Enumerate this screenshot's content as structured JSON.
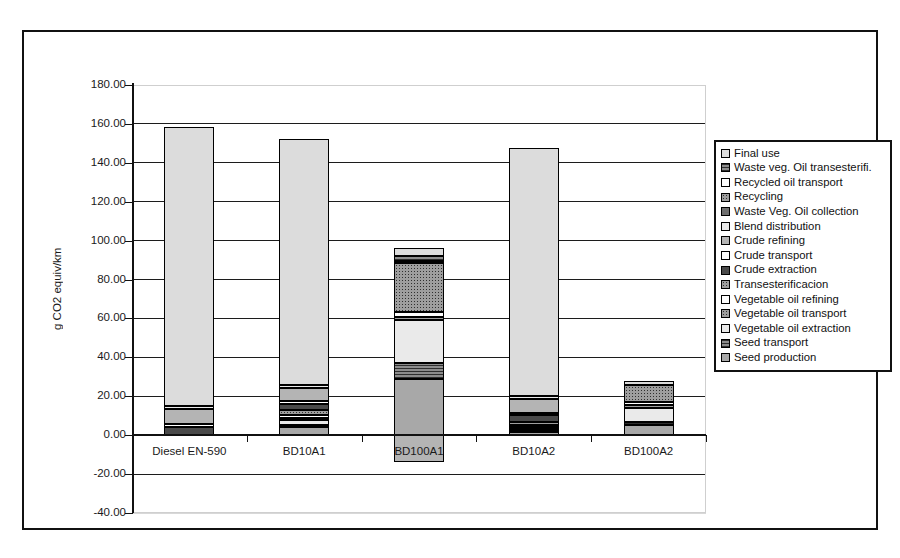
{
  "chart_data": {
    "type": "bar",
    "subtype": "stacked-bar",
    "title": "",
    "xlabel": "",
    "ylabel": "g CO2 equiv/km",
    "ylim": [
      -40,
      180
    ],
    "ytick_step": 20,
    "ytick_labels": [
      "180.00",
      "160.00",
      "140.00",
      "120.00",
      "100.00",
      "80.00",
      "60.00",
      "40.00",
      "20.00",
      "0.00",
      "-20.00",
      "-40.00"
    ],
    "ytick_values": [
      180,
      160,
      140,
      120,
      100,
      80,
      60,
      40,
      20,
      0,
      -20,
      -40
    ],
    "grid": true,
    "legend_position": "right",
    "categories": [
      "Diesel EN-590",
      "BD10A1",
      "BD100A1",
      "BD10A2",
      "BD100A2"
    ],
    "totals": [
      158.5,
      152.5,
      82.0,
      146.5,
      28.0
    ],
    "series": [
      {
        "name": "Final use",
        "pattern": "p-light",
        "values": [
          143.5,
          126.5,
          4.0,
          127.5,
          2.0
        ]
      },
      {
        "name": "Waste veg. Oil transesterifi.",
        "pattern": "p-hatchD",
        "values": [
          0,
          0,
          2.5,
          0,
          0
        ]
      },
      {
        "name": "Recycled oil transport",
        "pattern": "p-white",
        "values": [
          0,
          0,
          1.0,
          0,
          0
        ]
      },
      {
        "name": "Recycling",
        "pattern": "p-dotsD",
        "values": [
          0,
          0,
          0,
          0,
          0
        ]
      },
      {
        "name": "Waste Veg. Oil collection",
        "pattern": "p-dark",
        "values": [
          0,
          0,
          0,
          0,
          0
        ]
      },
      {
        "name": "Blend distribution",
        "pattern": "p-lighter",
        "values": [
          1.5,
          1.5,
          0,
          1.5,
          0
        ]
      },
      {
        "name": "Crude refining",
        "pattern": "p-mid",
        "values": [
          8.0,
          7.0,
          0,
          7.0,
          0
        ]
      },
      {
        "name": "Crude transport",
        "pattern": "p-white",
        "values": [
          1.5,
          1.3,
          0,
          1.3,
          0
        ]
      },
      {
        "name": "Crude extraction",
        "pattern": "p-darker",
        "values": [
          4.0,
          3.5,
          0,
          3.5,
          0
        ]
      },
      {
        "name": "Transesterificacion",
        "pattern": "p-dotsD",
        "values": [
          0,
          2.5,
          25.0,
          1.5,
          9.0
        ]
      },
      {
        "name": "Vegetable oil refining",
        "pattern": "p-white",
        "values": [
          0,
          1.2,
          2.5,
          1.2,
          1.5
        ]
      },
      {
        "name": "Vegetable oil transport",
        "pattern": "p-dotsD",
        "values": [
          0,
          1.0,
          2.0,
          0.8,
          1.5
        ]
      },
      {
        "name": "Vegetable oil extraction",
        "pattern": "p-lighter",
        "values": [
          0,
          3.0,
          22.0,
          1.0,
          7.0
        ]
      },
      {
        "name": "Seed  transport",
        "pattern": "p-hatchD",
        "values": [
          0,
          1.0,
          8.0,
          0.7,
          2.0
        ]
      },
      {
        "name": "Seed  production",
        "pattern": "p-mid2",
        "values": [
          0,
          4.0,
          29.0,
          1.5,
          5.0
        ]
      }
    ],
    "negative_segments": [
      {
        "category": "BD100A1",
        "series": "Final use credit",
        "value": -14.0,
        "pattern": "p-mid"
      }
    ]
  },
  "legend": {
    "items": [
      {
        "label": "Final use",
        "swatch": "light"
      },
      {
        "label": "Waste veg. Oil transesterifi.",
        "swatch": "dark"
      },
      {
        "label": "Recycled oil transport",
        "swatch": "light"
      },
      {
        "label": "Recycling",
        "swatch": "dark"
      },
      {
        "label": "Waste Veg. Oil collection",
        "swatch": "dark"
      },
      {
        "label": "Blend distribution",
        "swatch": "light"
      },
      {
        "label": "Crude refining",
        "swatch": "dark"
      },
      {
        "label": "Crude transport",
        "swatch": "light"
      },
      {
        "label": "Crude extraction",
        "swatch": "light"
      },
      {
        "label": "Transesterificacion",
        "swatch": "dark"
      },
      {
        "label": "Vegetable oil refining",
        "swatch": "light"
      },
      {
        "label": "Vegetable oil transport",
        "swatch": "dark"
      },
      {
        "label": "Vegetable oil extraction",
        "swatch": "light"
      },
      {
        "label": "Seed  transport",
        "swatch": "dark"
      },
      {
        "label": "Seed  production",
        "swatch": "light"
      }
    ]
  }
}
